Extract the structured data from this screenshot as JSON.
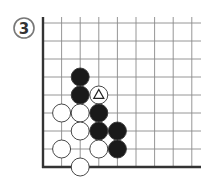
{
  "problem": {
    "label": "3",
    "label_style": "circled-number"
  },
  "board": {
    "origin_x": 43,
    "origin_y": 23,
    "spacing_x": 18.6,
    "spacing_y": 18.0,
    "columns": 9,
    "rows": 9,
    "right_extent": 201,
    "edges": [
      "left",
      "bottom"
    ],
    "line_color": "#8a8a8a",
    "edge_color": "#333333",
    "stone_radius": 9
  },
  "stones": [
    {
      "color": "black",
      "col": 2,
      "row": 3
    },
    {
      "color": "black",
      "col": 2,
      "row": 4
    },
    {
      "color": "white",
      "col": 3,
      "row": 4,
      "marker": "triangle"
    },
    {
      "color": "white",
      "col": 1,
      "row": 5
    },
    {
      "color": "white",
      "col": 2,
      "row": 5
    },
    {
      "color": "black",
      "col": 3,
      "row": 5
    },
    {
      "color": "white",
      "col": 2,
      "row": 6
    },
    {
      "color": "black",
      "col": 3,
      "row": 6
    },
    {
      "color": "black",
      "col": 4,
      "row": 6
    },
    {
      "color": "white",
      "col": 1,
      "row": 7
    },
    {
      "color": "white",
      "col": 3,
      "row": 7
    },
    {
      "color": "black",
      "col": 4,
      "row": 7
    },
    {
      "color": "white",
      "col": 2,
      "row": 8
    }
  ],
  "colors": {
    "black_stone": "#1a1a1a",
    "white_stone": "#ffffff",
    "stone_outline": "#333333"
  }
}
